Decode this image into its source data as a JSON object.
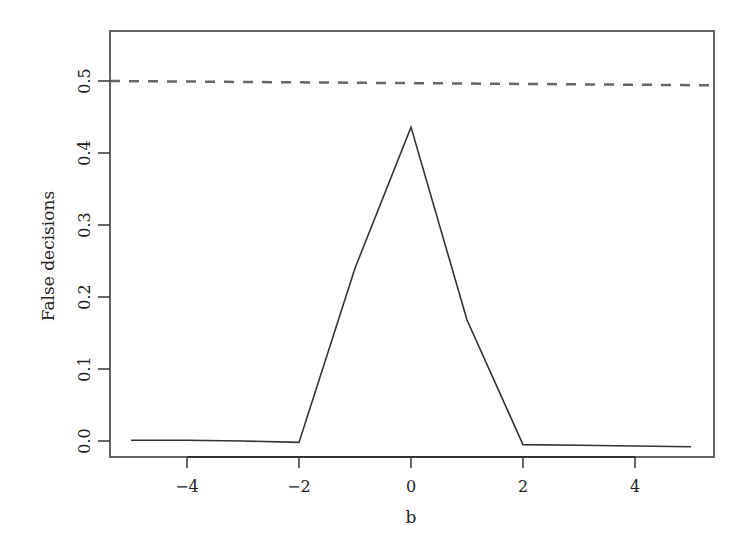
{
  "chart_data": {
    "type": "line",
    "title": "",
    "xlabel": "b",
    "ylabel": "False decisions",
    "xlim": [
      -5.4,
      5.4
    ],
    "ylim": [
      -0.022,
      0.565
    ],
    "grid": false,
    "legend": null,
    "x_ticks": [
      -4,
      -2,
      0,
      2,
      4
    ],
    "x_tick_labels": [
      "−4",
      "−2",
      "0",
      "2",
      "4"
    ],
    "y_ticks": [
      0.0,
      0.1,
      0.2,
      0.3,
      0.4,
      0.5
    ],
    "y_tick_labels": [
      "0.0",
      "0.1",
      "0.2",
      "0.3",
      "0.4",
      "0.5"
    ],
    "series": [
      {
        "name": "false decisions",
        "style": "solid",
        "color": "#333333",
        "x": [
          -5,
          -4,
          -3,
          -2,
          -1,
          0,
          1,
          2,
          3,
          4,
          5
        ],
        "values": [
          0.001,
          0.001,
          0.0,
          -0.002,
          0.24,
          0.436,
          0.168,
          -0.005,
          -0.006,
          -0.007,
          -0.008
        ]
      },
      {
        "name": "reference",
        "style": "dashed",
        "color": "#666666",
        "x": [
          -5.4,
          5.4
        ],
        "values": [
          0.5,
          0.494
        ]
      }
    ]
  }
}
